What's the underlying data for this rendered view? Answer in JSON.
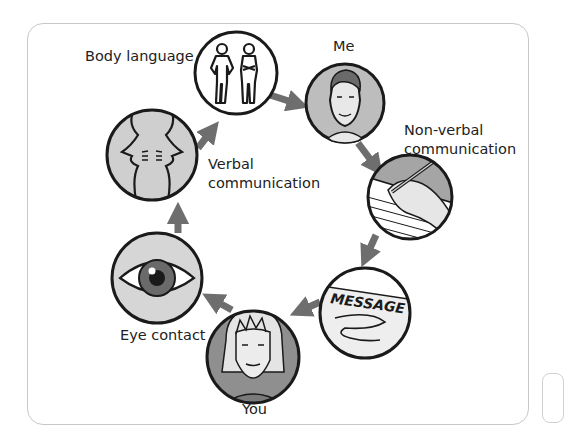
{
  "diagram": {
    "type": "communication-cycle",
    "nodes": [
      {
        "id": "me",
        "label": "Me",
        "icon": "man-face-icon"
      },
      {
        "id": "non_verbal",
        "label_line1": "Non-verbal",
        "label_line2": "communication",
        "icon": "hand-writing-icon"
      },
      {
        "id": "message",
        "label": "",
        "icon_text": "MESSAGE",
        "icon": "message-note-icon"
      },
      {
        "id": "you",
        "label": "You",
        "icon": "woman-face-icon"
      },
      {
        "id": "eye_contact",
        "label": "Eye contact",
        "icon": "eye-icon"
      },
      {
        "id": "verbal",
        "label_line1": "Verbal",
        "label_line2": "communication",
        "icon": "two-faces-talking-icon"
      },
      {
        "id": "body_language",
        "label": "Body language",
        "icon": "two-people-posture-icon"
      }
    ],
    "edges": [
      [
        "body_language",
        "me"
      ],
      [
        "me",
        "non_verbal"
      ],
      [
        "non_verbal",
        "message"
      ],
      [
        "message",
        "you"
      ],
      [
        "you",
        "eye_contact"
      ],
      [
        "eye_contact",
        "verbal"
      ],
      [
        "verbal",
        "body_language"
      ]
    ],
    "colors": {
      "arrow": "#6e6e6e",
      "circle_stroke": "#1a1a1a",
      "light_fill": "#d9d9d9",
      "mid_fill": "#a9a9a9",
      "white_fill": "#ffffff",
      "frame_border": "#c8c8c8"
    }
  },
  "labels": {
    "me": "Me",
    "non_verbal_1": "Non-verbal",
    "non_verbal_2": "communication",
    "message_text": "MESSAGE",
    "you": "You",
    "eye_contact": "Eye contact",
    "verbal_1": "Verbal",
    "verbal_2": "communication",
    "body_language": "Body language"
  }
}
